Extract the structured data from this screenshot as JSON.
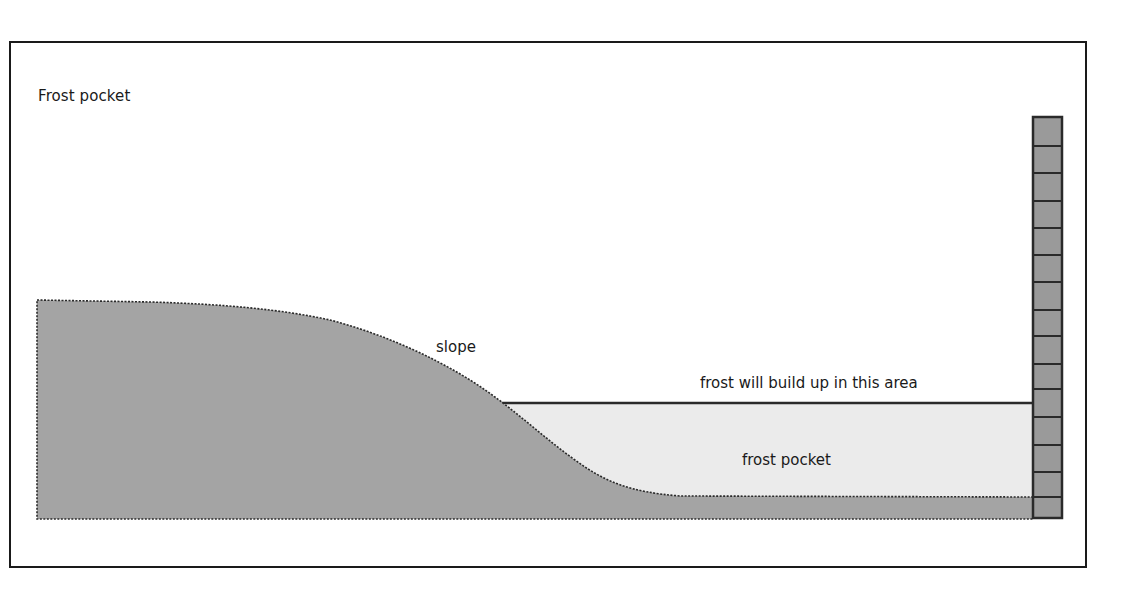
{
  "title": "Frost pocket",
  "labels": {
    "slope": "slope",
    "frost_line": "frost will build up in this area",
    "frost_pocket": "frost pocket"
  },
  "colors": {
    "ground": "#a4a4a4",
    "frost": "#ebebeb",
    "outline": "#2a2a2a",
    "wall": "#9a9a9a"
  },
  "wall": {
    "brick_count": 15
  }
}
